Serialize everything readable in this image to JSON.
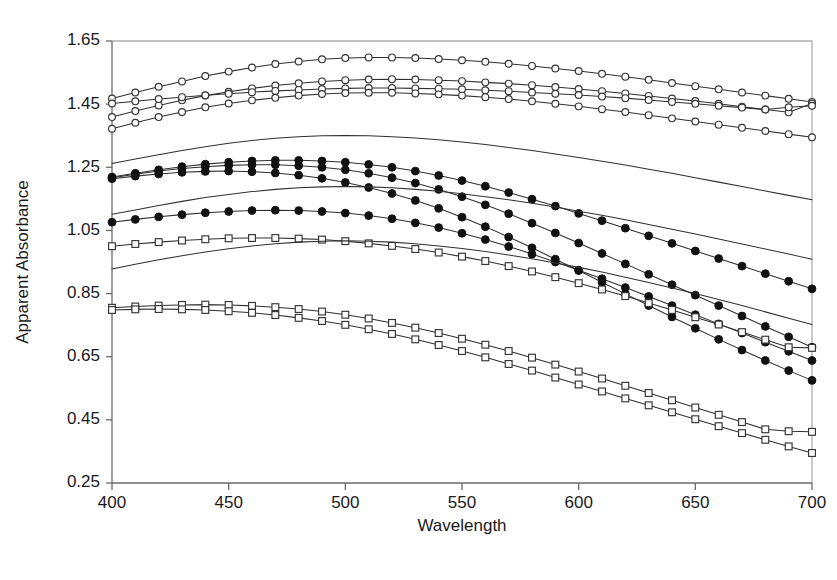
{
  "chart_data": {
    "type": "line",
    "title": "",
    "xlabel": "Wavelength",
    "ylabel": "Apparent Absorbance",
    "xlim": [
      400,
      700
    ],
    "ylim": [
      0.25,
      1.65
    ],
    "xticks": [
      400,
      450,
      500,
      550,
      600,
      650,
      700
    ],
    "yticks": [
      0.25,
      0.45,
      0.65,
      0.85,
      1.05,
      1.25,
      1.45,
      1.65
    ],
    "xtick_labels": [
      "400",
      "450",
      "500",
      "550",
      "600",
      "650",
      "700"
    ],
    "ytick_labels": [
      "0.25",
      "0.45",
      "0.65",
      "0.85",
      "1.05",
      "1.25",
      "1.45",
      "1.65"
    ],
    "grid": false,
    "legend": "none",
    "x": [
      400,
      410,
      420,
      430,
      440,
      450,
      460,
      470,
      480,
      490,
      500,
      510,
      520,
      530,
      540,
      550,
      560,
      570,
      580,
      590,
      600,
      610,
      620,
      630,
      640,
      650,
      660,
      670,
      680,
      690,
      700
    ],
    "marker_colors": {
      "open": "#ffffff",
      "edge": "#343434",
      "filled": "#111111"
    },
    "series": [
      {
        "name": "open-circle-1",
        "marker": "open-circle",
        "values": [
          1.468,
          1.487,
          1.505,
          1.522,
          1.539,
          1.553,
          1.566,
          1.577,
          1.585,
          1.592,
          1.596,
          1.598,
          1.598,
          1.596,
          1.593,
          1.589,
          1.584,
          1.578,
          1.571,
          1.563,
          1.555,
          1.546,
          1.537,
          1.527,
          1.517,
          1.507,
          1.497,
          1.487,
          1.477,
          1.467,
          1.457
        ]
      },
      {
        "name": "open-circle-2",
        "marker": "open-circle",
        "values": [
          1.409,
          1.428,
          1.446,
          1.462,
          1.477,
          1.489,
          1.5,
          1.509,
          1.516,
          1.522,
          1.526,
          1.528,
          1.529,
          1.528,
          1.526,
          1.523,
          1.519,
          1.515,
          1.51,
          1.504,
          1.498,
          1.491,
          1.484,
          1.476,
          1.468,
          1.46,
          1.451,
          1.442,
          1.433,
          1.424,
          1.452
        ]
      },
      {
        "name": "open-circle-3",
        "marker": "open-circle",
        "values": [
          1.452,
          1.459,
          1.466,
          1.472,
          1.478,
          1.483,
          1.488,
          1.492,
          1.495,
          1.498,
          1.5,
          1.501,
          1.501,
          1.5,
          1.499,
          1.497,
          1.494,
          1.491,
          1.487,
          1.483,
          1.479,
          1.474,
          1.469,
          1.463,
          1.457,
          1.451,
          1.445,
          1.439,
          1.433,
          1.44,
          1.445
        ]
      },
      {
        "name": "open-circle-4",
        "marker": "open-circle",
        "values": [
          1.372,
          1.391,
          1.409,
          1.425,
          1.44,
          1.452,
          1.462,
          1.47,
          1.477,
          1.482,
          1.485,
          1.486,
          1.486,
          1.484,
          1.481,
          1.477,
          1.472,
          1.466,
          1.459,
          1.451,
          1.443,
          1.434,
          1.425,
          1.415,
          1.405,
          1.395,
          1.385,
          1.375,
          1.365,
          1.355,
          1.345
        ]
      },
      {
        "name": "plain-line-1",
        "marker": "none",
        "values": [
          1.262,
          1.276,
          1.29,
          1.303,
          1.315,
          1.326,
          1.335,
          1.342,
          1.347,
          1.35,
          1.351,
          1.35,
          1.347,
          1.343,
          1.337,
          1.33,
          1.322,
          1.313,
          1.303,
          1.292,
          1.281,
          1.269,
          1.257,
          1.244,
          1.231,
          1.217,
          1.203,
          1.189,
          1.175,
          1.161,
          1.147
        ]
      },
      {
        "name": "filled-circle-1",
        "marker": "filled-circle",
        "values": [
          1.219,
          1.231,
          1.242,
          1.252,
          1.26,
          1.266,
          1.27,
          1.272,
          1.272,
          1.27,
          1.266,
          1.259,
          1.25,
          1.238,
          1.224,
          1.208,
          1.19,
          1.17,
          1.149,
          1.127,
          1.104,
          1.081,
          1.057,
          1.033,
          1.009,
          0.985,
          0.961,
          0.937,
          0.913,
          0.889,
          0.865
        ]
      },
      {
        "name": "filled-circle-2",
        "marker": "filled-circle",
        "values": [
          1.217,
          1.228,
          1.238,
          1.246,
          1.252,
          1.256,
          1.258,
          1.258,
          1.255,
          1.25,
          1.242,
          1.231,
          1.217,
          1.2,
          1.18,
          1.157,
          1.131,
          1.103,
          1.073,
          1.042,
          1.01,
          0.977,
          0.944,
          0.911,
          0.878,
          0.845,
          0.812,
          0.779,
          0.746,
          0.713,
          0.68
        ]
      },
      {
        "name": "filled-circle-3",
        "marker": "filled-circle",
        "values": [
          1.214,
          1.222,
          1.229,
          1.234,
          1.237,
          1.238,
          1.236,
          1.232,
          1.225,
          1.215,
          1.202,
          1.186,
          1.167,
          1.145,
          1.12,
          1.092,
          1.062,
          1.029,
          0.995,
          0.959,
          0.923,
          0.886,
          0.849,
          0.812,
          0.776,
          0.74,
          0.705,
          0.671,
          0.638,
          0.606,
          0.575
        ]
      },
      {
        "name": "plain-line-2",
        "marker": "none",
        "values": [
          1.101,
          1.115,
          1.129,
          1.142,
          1.154,
          1.164,
          1.173,
          1.18,
          1.185,
          1.188,
          1.189,
          1.188,
          1.185,
          1.18,
          1.174,
          1.166,
          1.157,
          1.147,
          1.136,
          1.124,
          1.111,
          1.098,
          1.084,
          1.069,
          1.054,
          1.039,
          1.023,
          1.007,
          0.991,
          0.975,
          0.959
        ]
      },
      {
        "name": "filled-circle-4",
        "marker": "filled-circle",
        "values": [
          1.076,
          1.085,
          1.093,
          1.1,
          1.106,
          1.11,
          1.113,
          1.114,
          1.113,
          1.11,
          1.105,
          1.097,
          1.087,
          1.074,
          1.059,
          1.041,
          1.021,
          0.999,
          0.975,
          0.95,
          0.924,
          0.897,
          0.869,
          0.841,
          0.812,
          0.783,
          0.754,
          0.725,
          0.696,
          0.667,
          0.638
        ]
      },
      {
        "name": "open-square-1",
        "marker": "open-square",
        "values": [
          1.0,
          1.007,
          1.013,
          1.018,
          1.022,
          1.025,
          1.026,
          1.026,
          1.024,
          1.021,
          1.016,
          1.009,
          1.001,
          0.991,
          0.98,
          0.967,
          0.953,
          0.937,
          0.92,
          0.902,
          0.883,
          0.863,
          0.842,
          0.82,
          0.798,
          0.775,
          0.752,
          0.728,
          0.704,
          0.68,
          0.678
        ]
      },
      {
        "name": "plain-line-3",
        "marker": "none",
        "values": [
          0.928,
          0.943,
          0.957,
          0.97,
          0.982,
          0.992,
          1.001,
          1.008,
          1.013,
          1.016,
          1.017,
          1.016,
          1.013,
          1.008,
          1.001,
          0.993,
          0.983,
          0.972,
          0.96,
          0.947,
          0.933,
          0.918,
          0.902,
          0.885,
          0.868,
          0.85,
          0.831,
          0.812,
          0.792,
          0.772,
          0.752
        ]
      },
      {
        "name": "open-square-2",
        "marker": "open-square",
        "values": [
          0.805,
          0.809,
          0.812,
          0.814,
          0.815,
          0.814,
          0.811,
          0.807,
          0.801,
          0.793,
          0.783,
          0.771,
          0.757,
          0.742,
          0.725,
          0.707,
          0.688,
          0.668,
          0.647,
          0.625,
          0.603,
          0.581,
          0.558,
          0.535,
          0.512,
          0.489,
          0.466,
          0.443,
          0.42,
          0.414,
          0.412
        ]
      },
      {
        "name": "open-square-3",
        "marker": "open-square",
        "values": [
          0.798,
          0.8,
          0.801,
          0.8,
          0.798,
          0.794,
          0.789,
          0.782,
          0.773,
          0.763,
          0.751,
          0.737,
          0.722,
          0.705,
          0.687,
          0.668,
          0.648,
          0.627,
          0.606,
          0.584,
          0.562,
          0.54,
          0.518,
          0.496,
          0.474,
          0.452,
          0.43,
          0.408,
          0.387,
          0.366,
          0.345
        ]
      }
    ]
  },
  "figure": {
    "background_color": "#ffffff",
    "line_color": "#303030",
    "axis_color": "#6b6b6b"
  }
}
